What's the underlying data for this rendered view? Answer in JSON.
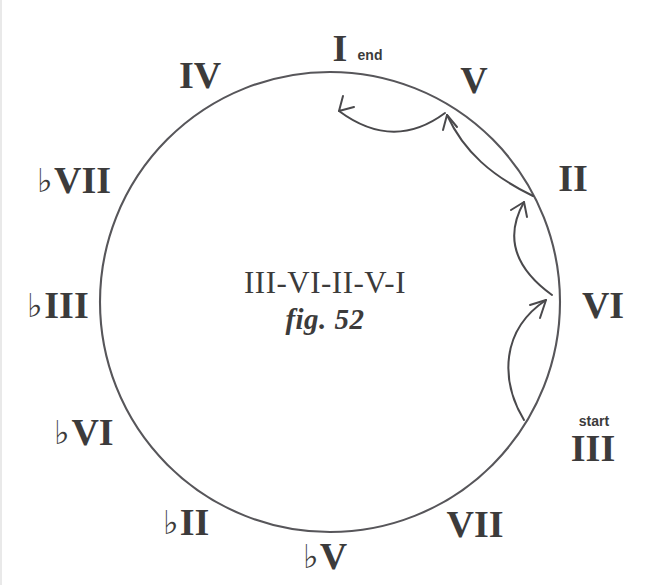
{
  "figure": {
    "caption": "fig. 52",
    "progression": "III-VI-II-V-I",
    "ink_color": "#3c3b3b",
    "background_color": "#ffffff"
  },
  "circle": {
    "center_x": 330,
    "center_y": 302,
    "radius": 230
  },
  "markers": {
    "start": {
      "label": "start",
      "x": 594,
      "y": 421
    },
    "end": {
      "label": "end",
      "x": 370,
      "y": 55
    }
  },
  "degrees": [
    {
      "id": "i",
      "text": "I",
      "flat": "",
      "numeral": "I",
      "x": 340,
      "y": 48,
      "angle_deg": 90
    },
    {
      "id": "v",
      "text": "V",
      "flat": "",
      "numeral": "V",
      "x": 474,
      "y": 80,
      "angle_deg": 60
    },
    {
      "id": "ii",
      "text": "II",
      "flat": "",
      "numeral": "II",
      "x": 573,
      "y": 178,
      "angle_deg": 30
    },
    {
      "id": "vi",
      "text": "VI",
      "flat": "",
      "numeral": "VI",
      "x": 603,
      "y": 305,
      "angle_deg": 0
    },
    {
      "id": "iii",
      "text": "III",
      "flat": "",
      "numeral": "III",
      "x": 593,
      "y": 448,
      "angle_deg": -30
    },
    {
      "id": "vii",
      "text": "VII",
      "flat": "",
      "numeral": "VII",
      "x": 475,
      "y": 524,
      "angle_deg": -60
    },
    {
      "id": "flat5",
      "text": "♭V",
      "flat": "♭",
      "numeral": "V",
      "x": 325,
      "y": 556,
      "angle_deg": -90
    },
    {
      "id": "flat2",
      "text": "♭II",
      "flat": "♭",
      "numeral": "II",
      "x": 186,
      "y": 522,
      "angle_deg": -120
    },
    {
      "id": "flat6",
      "text": "♭VI",
      "flat": "♭",
      "numeral": "VI",
      "x": 84,
      "y": 432,
      "angle_deg": -150
    },
    {
      "id": "flat3",
      "text": "♭III",
      "flat": "♭",
      "numeral": "III",
      "x": 58,
      "y": 305,
      "angle_deg": 180
    },
    {
      "id": "flat7",
      "text": "♭VII",
      "flat": "♭",
      "numeral": "VII",
      "x": 74,
      "y": 180,
      "angle_deg": 150
    },
    {
      "id": "iv",
      "text": "IV",
      "flat": "",
      "numeral": "IV",
      "x": 200,
      "y": 75,
      "angle_deg": 120
    }
  ],
  "arrows": [
    {
      "id": "iii-to-vi",
      "from": "III",
      "to": "VI",
      "path": "M 524 420 C 500 380 501 330 546 300",
      "head": "M 546 300 L 531 306 M 546 300 L 541 316"
    },
    {
      "id": "vi-to-ii",
      "from": "VI",
      "to": "II",
      "path": "M 552 293 C 512 262 510 232 525 200",
      "head": "M 525 200 L 513 208 M 525 200 L 527 215"
    },
    {
      "id": "ii-to-v",
      "from": "II",
      "to": "V",
      "path": "M 532 195 C 492 174 465 152 446 114",
      "head": "M 446 114 L 443 129 M 446 114 L 455 126"
    },
    {
      "id": "v-to-i",
      "from": "V",
      "to": "I",
      "path": "M 444 112 C 415 134 380 138 340 112",
      "head": "M 340 112 L 344 97 M 340 112 L 354 107"
    }
  ]
}
